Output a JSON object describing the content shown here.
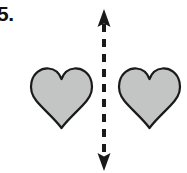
{
  "page": {
    "background_color": "#ffffff",
    "width": 187,
    "height": 173
  },
  "problem": {
    "number_label": "5.",
    "task_type": "line-of-symmetry-identification"
  },
  "figure": {
    "shapes": [
      {
        "name": "heart-left",
        "shape": "heart",
        "fill_color": "#c3c5c5",
        "stroke_color": "#1a1a1a",
        "stroke_width": 2,
        "x": 31,
        "y": 68,
        "width": 61,
        "height": 60
      },
      {
        "name": "heart-right",
        "shape": "heart",
        "fill_color": "#c3c5c5",
        "stroke_color": "#1a1a1a",
        "stroke_width": 2,
        "x": 119,
        "y": 68,
        "width": 61,
        "height": 60
      }
    ],
    "symmetry_line": {
      "name": "mirror-line",
      "orientation": "vertical",
      "style": "dashed",
      "color": "#1a1a1a",
      "stroke_width": 4,
      "dash_length": 8,
      "gap_length": 7,
      "x": 104,
      "y_top": 10,
      "y_bottom": 170,
      "arrowheads": "both",
      "arrowhead_width": 13,
      "arrowhead_height": 15
    }
  }
}
